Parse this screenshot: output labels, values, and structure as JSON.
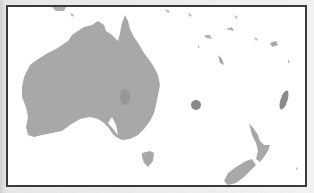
{
  "map": {
    "title": "Australia and Oceania outline map",
    "background_color": "#ffffff",
    "land_color": "#a8a8a8",
    "highlight_color": "#8a8a8a",
    "frame_color": "#3a3a3a",
    "regions": [
      {
        "name": "Australia",
        "type": "landmass"
      },
      {
        "name": "Tasmania",
        "type": "island"
      },
      {
        "name": "New Zealand North Island",
        "type": "island"
      },
      {
        "name": "New Zealand South Island",
        "type": "island"
      },
      {
        "name": "New Caledonia",
        "type": "island"
      },
      {
        "name": "Vanuatu",
        "type": "island-group"
      },
      {
        "name": "Fiji",
        "type": "island-group"
      },
      {
        "name": "Solomon Islands",
        "type": "island-group"
      },
      {
        "name": "Papua New Guinea (south tip)",
        "type": "landmass"
      }
    ],
    "markers": [
      {
        "name": "central-australia-marker",
        "shape": "ellipse"
      },
      {
        "name": "tasman-sea-marker",
        "shape": "circle"
      },
      {
        "name": "new-caledonia-marker",
        "shape": "ellipse"
      }
    ]
  }
}
